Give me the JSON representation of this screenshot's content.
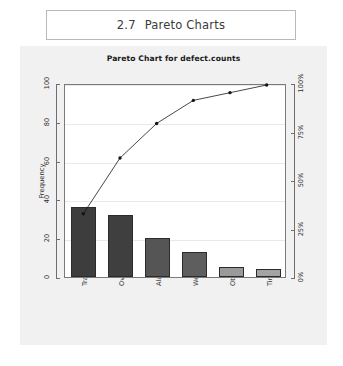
{
  "section": {
    "number": "2.7",
    "title": "Pareto Charts"
  },
  "chart_data": {
    "type": "bar",
    "title": "Pareto Chart for defect.counts",
    "categories": [
      "Traffic",
      "Overslept",
      "Alarm Failure",
      "Weather",
      "Other",
      "Time Change"
    ],
    "values": [
      36,
      32,
      20,
      13,
      5,
      4
    ],
    "cumulative_percent": [
      33,
      62,
      80,
      92,
      96,
      100
    ],
    "xlabel": "",
    "ylabel": "Frequency",
    "y2label": "Cumulative Percentage",
    "ylim": [
      0,
      100
    ],
    "y2lim": [
      0,
      100
    ],
    "yticks": [
      "0",
      "20",
      "40",
      "60",
      "80",
      "100"
    ],
    "ytick_values": [
      0,
      20,
      40,
      60,
      80,
      100
    ],
    "y2ticks": [
      "0%",
      "25%",
      "50%",
      "75%",
      "100%"
    ],
    "y2tick_values": [
      0,
      25,
      50,
      75,
      100
    ],
    "grid": true,
    "legend": "none",
    "colors": {
      "bar_dark": "#3d3d3d",
      "bar_mid": "#565656",
      "bar_light": "#9a9a9a",
      "line": "#151515",
      "panel_background": "#f1f1f1",
      "plot_background": "#ffffff",
      "axis": "#6e6e6e"
    },
    "bar_colors": [
      "#3d3d3d",
      "#3f3f3f",
      "#555555",
      "#5e5e5e",
      "#9a9a9a",
      "#a3a3a3"
    ]
  }
}
